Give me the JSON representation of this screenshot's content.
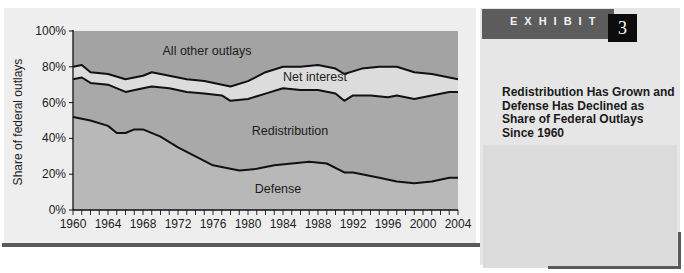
{
  "exhibit": {
    "label": "EXHIBIT",
    "number": "3",
    "title": "Redistribution Has Grown and Defense Has Declined as Share of Federal Outlays Since 1960"
  },
  "colors": {
    "dark_region": "#a3a3a3",
    "light_region": "#dcdcdc",
    "mid_region": "#b8b8b8",
    "line": "#111111",
    "exhibit_bar": "#5c5c5c",
    "exhibit_box": "#0c0c0c"
  },
  "chart_data": {
    "type": "area",
    "stacked": true,
    "title": "Redistribution Has Grown and Defense Has Declined as Share of Federal Outlays Since 1960",
    "xlabel": "",
    "ylabel": "Share of federal outlays",
    "xlim": [
      1960,
      2004
    ],
    "ylim": [
      0,
      100
    ],
    "x_tick_labels": [
      "1960",
      "1964",
      "1968",
      "1972",
      "1976",
      "1980",
      "1984",
      "1988",
      "1992",
      "1996",
      "2000",
      "2004"
    ],
    "y_tick_labels": [
      "0%",
      "20%",
      "40%",
      "60%",
      "80%",
      "100%"
    ],
    "grid": false,
    "legend": "inline region labels",
    "region_labels": [
      "All other outlays",
      "Net interest",
      "Redistribution",
      "Defense"
    ],
    "boundaries": {
      "defense_top": {
        "x": [
          1960,
          1962,
          1964,
          1965,
          1966,
          1967,
          1968,
          1970,
          1972,
          1974,
          1976,
          1978,
          1979,
          1981,
          1983,
          1985,
          1987,
          1989,
          1991,
          1992,
          1993,
          1995,
          1997,
          1999,
          2001,
          2003,
          2004
        ],
        "y": [
          52,
          50,
          47,
          43,
          43,
          45,
          45,
          41,
          35,
          30,
          25,
          23,
          22,
          23,
          25,
          26,
          27,
          26,
          21,
          21,
          20,
          18,
          16,
          15,
          16,
          18,
          18
        ]
      },
      "redistribution_top": {
        "x": [
          1960,
          1961,
          1962,
          1964,
          1966,
          1968,
          1969,
          1971,
          1973,
          1975,
          1977,
          1978,
          1980,
          1982,
          1984,
          1986,
          1988,
          1990,
          1991,
          1992,
          1994,
          1996,
          1997,
          1999,
          2001,
          2003,
          2004
        ],
        "y": [
          73,
          74,
          71,
          70,
          66,
          68,
          69,
          68,
          66,
          65,
          64,
          61,
          62,
          65,
          68,
          67,
          67,
          65,
          61,
          64,
          64,
          63,
          64,
          62,
          64,
          66,
          66
        ]
      },
      "net_interest_top": {
        "x": [
          1960,
          1961,
          1962,
          1964,
          1966,
          1968,
          1969,
          1971,
          1973,
          1975,
          1978,
          1980,
          1982,
          1984,
          1986,
          1988,
          1990,
          1991,
          1993,
          1995,
          1997,
          1999,
          2001,
          2004
        ],
        "y": [
          80,
          81,
          77,
          76,
          73,
          75,
          77,
          75,
          73,
          72,
          69,
          72,
          77,
          80,
          80,
          81,
          79,
          76,
          79,
          80,
          80,
          77,
          76,
          73
        ]
      }
    },
    "series": [
      {
        "name": "Defense",
        "approx_start_1960": 52,
        "approx_end_2004": 18
      },
      {
        "name": "Redistribution",
        "approx_start_1960": 21,
        "approx_end_2004": 48
      },
      {
        "name": "Net interest",
        "approx_start_1960": 7,
        "approx_end_2004": 7
      },
      {
        "name": "All other outlays",
        "approx_start_1960": 20,
        "approx_end_2004": 27
      }
    ]
  }
}
